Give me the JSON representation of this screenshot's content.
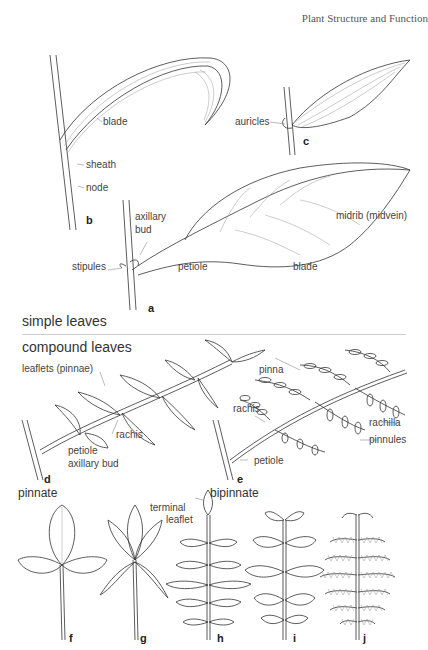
{
  "running_head": "Plant Structure and Function",
  "sections": {
    "simple": "simple leaves",
    "compound": "compound leaves"
  },
  "figures": {
    "a": {
      "letter": "a",
      "labels": {
        "axillary_bud": "axillary\nbud",
        "axillary": "axillary",
        "bud": "bud",
        "midrib": "midrib (midvein)",
        "stipules": "stipules",
        "petiole": "petiole",
        "blade": "blade"
      }
    },
    "b": {
      "letter": "b",
      "labels": {
        "blade": "blade",
        "sheath": "sheath",
        "node": "node"
      }
    },
    "c": {
      "letter": "c",
      "labels": {
        "auricles": "auricles"
      }
    },
    "d": {
      "letter": "d",
      "caption": "pinnate",
      "labels": {
        "leaflets": "leaflets (pinnae)",
        "rachis": "rachis",
        "petiole": "petiole",
        "axillary_bud": "axillary bud"
      }
    },
    "e": {
      "letter": "e",
      "caption": "bipinnate",
      "labels": {
        "pinna": "pinna",
        "rachis": "rachis",
        "rachilla": "rachilla",
        "pinnules": "pinnules",
        "petiole": "petiole"
      }
    },
    "f": {
      "letter": "f"
    },
    "g": {
      "letter": "g"
    },
    "h": {
      "letter": "h",
      "labels": {
        "terminal": "terminal",
        "leaflet": "leaflet"
      }
    },
    "i": {
      "letter": "i"
    },
    "j": {
      "letter": "j"
    }
  }
}
